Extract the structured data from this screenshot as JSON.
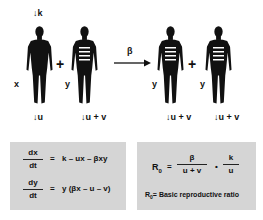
{
  "diagram": {
    "top_inflow": {
      "arrow": "↓",
      "label": "k"
    },
    "figures": [
      {
        "id": "x",
        "label": "x",
        "infected": false,
        "outflow": "u"
      },
      {
        "id": "y1",
        "label": "y",
        "infected": true,
        "outflow": "u + v"
      },
      {
        "id": "y2",
        "label": "y",
        "infected": true,
        "outflow": "u + v"
      },
      {
        "id": "y3",
        "label": "y",
        "infected": true,
        "outflow": "u + v"
      }
    ],
    "plus_sign": "+",
    "down_arrow": "↓",
    "transmission": {
      "label": "β"
    }
  },
  "equations_box": {
    "eq1": {
      "numerator": "dx",
      "denominator": "dt",
      "equals": "=",
      "rhs": "k – ux – βxy"
    },
    "eq2": {
      "numerator": "dy",
      "denominator": "dt",
      "equals": "=",
      "rhs": "y (βx – u – v)"
    }
  },
  "r0_box": {
    "lhs": "R",
    "lhs_sub": "0",
    "equals": "=",
    "frac1": {
      "numerator": "β",
      "denominator": "u + v"
    },
    "dot": "•",
    "frac2": {
      "numerator": "k",
      "denominator": "u"
    },
    "definition": {
      "symbol": "R",
      "sub": "0",
      "text": "= Basic reproductive ratio"
    }
  },
  "colors": {
    "figure": "#111111",
    "stripe": "#ffffff",
    "box_fill": "#d5d5d5"
  }
}
